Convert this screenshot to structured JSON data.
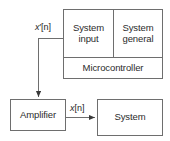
{
  "diagram": {
    "type": "block-diagram",
    "background_color": "#ffffff",
    "stroke_color": "#6e6e6e",
    "text_color": "#2b2b2b",
    "blocks": [
      {
        "id": "system-input",
        "label": "System input",
        "line1": "System",
        "line2": "input"
      },
      {
        "id": "system-general",
        "label": "System general",
        "line1": "System",
        "line2": "general"
      },
      {
        "id": "microcontroller",
        "label": "Microcontroller",
        "line1": "Microcontroller",
        "line2": ""
      },
      {
        "id": "amplifier",
        "label": "Amplifier",
        "line1": "Amplifier",
        "line2": ""
      },
      {
        "id": "system",
        "label": "System",
        "line1": "System",
        "line2": ""
      }
    ],
    "signals": [
      {
        "id": "x-prime-n",
        "variable": "x",
        "prime": "′",
        "index": "[n]",
        "text": "x′[n]",
        "from": "system-input",
        "to": "amplifier"
      },
      {
        "id": "x-n",
        "variable": "x",
        "prime": "",
        "index": "[n]",
        "text": "x[n]",
        "from": "amplifier",
        "to": "system"
      }
    ]
  }
}
